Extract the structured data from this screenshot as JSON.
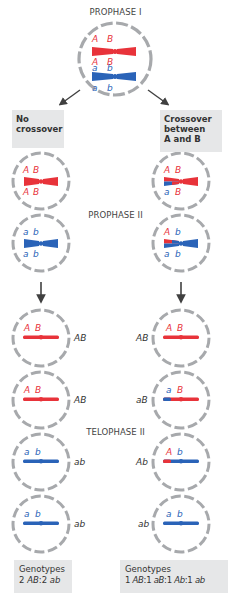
{
  "colors": {
    "red": "#e8333a",
    "blue": "#2a63b8",
    "membrane": "#a7a9ac",
    "box_bg": "#e6e7e8",
    "arrow": "#404040"
  },
  "labels": {
    "prophase1": "PROPHASE I",
    "prophase2": "PROPHASE II",
    "telophase2": "TELOPHASE II"
  },
  "branches": {
    "left": {
      "title_line1": "No",
      "title_line2": "crossover"
    },
    "right": {
      "title_line1": "Crossover",
      "title_line2": "between",
      "title_line3": "A and B"
    }
  },
  "prophase1_cell": {
    "top": [
      "A",
      "B"
    ],
    "mid_top": [
      "A",
      "B"
    ],
    "mid_bottom": [
      "a",
      "b"
    ],
    "bottom": [
      "a",
      "b"
    ]
  },
  "prophase2": {
    "left": [
      {
        "top": [
          "A",
          "B"
        ],
        "bottom": [
          "A",
          "B"
        ]
      },
      {
        "top": [
          "a",
          "b"
        ],
        "bottom": [
          "a",
          "b"
        ]
      }
    ],
    "right": [
      {
        "top": [
          "A",
          "B"
        ],
        "bottom": [
          "a",
          "B"
        ]
      },
      {
        "top": [
          "A",
          "b"
        ],
        "bottom": [
          "a",
          "b"
        ]
      }
    ]
  },
  "telophase2": {
    "left": [
      {
        "alleles": [
          "A",
          "B"
        ],
        "genotype": "AB"
      },
      {
        "alleles": [
          "A",
          "B"
        ],
        "genotype": "AB"
      },
      {
        "alleles": [
          "a",
          "b"
        ],
        "genotype": "ab"
      },
      {
        "alleles": [
          "a",
          "b"
        ],
        "genotype": "ab"
      }
    ],
    "right": [
      {
        "alleles": [
          "A",
          "B"
        ],
        "genotype": "AB"
      },
      {
        "alleles": [
          "a",
          "B"
        ],
        "genotype": "aB"
      },
      {
        "alleles": [
          "A",
          "b"
        ],
        "genotype": "Ab"
      },
      {
        "alleles": [
          "a",
          "b"
        ],
        "genotype": "ab"
      }
    ]
  },
  "genotypes": {
    "left": {
      "title": "Genotypes",
      "ratio_parts": [
        "2 ",
        "AB",
        ":2 ",
        "ab"
      ]
    },
    "right": {
      "title": "Genotypes",
      "ratio_parts": [
        "1 ",
        "AB",
        ":1 ",
        "aB",
        ":1 ",
        "Ab",
        ":1 ",
        "ab"
      ]
    }
  }
}
